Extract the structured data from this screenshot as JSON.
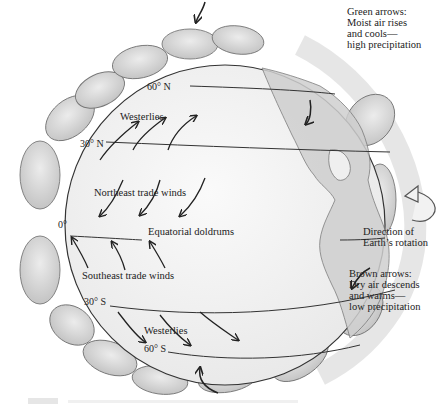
{
  "diagram": {
    "latitudes": {
      "n60": "60° N",
      "n30": "30° N",
      "eq": "0°",
      "s30": "30° S",
      "s60": "60° S"
    },
    "wind_labels": {
      "westerlies_north": "Westerlies",
      "ne_trades": "Northeast trade winds",
      "doldrums": "Equatorial doldrums",
      "se_trades": "Southeast trade winds",
      "westerlies_south": "Westerlies"
    },
    "callouts": {
      "green": [
        "Green arrows:",
        "Moist air rises",
        "and cools—",
        "high precipitation"
      ],
      "rotation": [
        "Direction of",
        "Earth’s rotation"
      ],
      "brown": [
        "Brown arrows:",
        "Dry air descends",
        "and warms—",
        "low precipitation"
      ]
    },
    "colors": {
      "globe_fill": "#f4f4f4",
      "cell_fill": "#d9d9d9",
      "land_fill": "#c8c8c8",
      "ink": "#222222"
    }
  }
}
